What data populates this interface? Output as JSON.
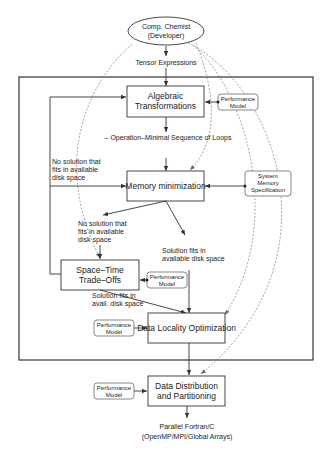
{
  "diagram": {
    "actor": {
      "line1": "Comp. Chemist",
      "line2": "(Developer)"
    },
    "input_label": "Tensor Expressions",
    "stages": {
      "algebraic": {
        "line1": "Algebraic",
        "line2": "Transformations"
      },
      "memory": {
        "line1": "Memory minimization"
      },
      "spacetime": {
        "line1": "Space–Time",
        "line2": "Trade–Offs"
      },
      "locality": {
        "line1": "Data Locality Optimization"
      },
      "distribution": {
        "line1": "Data Distribution",
        "line2": "and Partitioning"
      }
    },
    "side_inputs": {
      "perf_model_1": {
        "line1": "Performance",
        "line2": "Model"
      },
      "system_memory": {
        "line1": "System",
        "line2": "Memory",
        "line3": "Specification"
      },
      "perf_model_2": {
        "line1": "Performance",
        "line2": "Model"
      },
      "perf_model_3": {
        "line1": "Performance",
        "line2": "Model"
      },
      "perf_model_4": {
        "line1": "Performance",
        "line2": "Model"
      }
    },
    "edge_labels": {
      "op_minimal": "– Operation–Minimal Sequence of Loops",
      "no_solution_left": {
        "line1": "No solution that",
        "line2": "fits in available",
        "line3": "disk space"
      },
      "no_solution_mid": {
        "line1": "No solution that",
        "line2": "fits in available",
        "line3": "disk space"
      },
      "solution_fits": {
        "line1": "Solution fits in",
        "line2": "available disk space"
      },
      "solution_fits_avail": {
        "line1": "Solution fits in",
        "line2": "avail. disk space"
      }
    },
    "output": {
      "line1": "Parallel Fortran/C",
      "line2": "(OpenMP/MPI/Global Arrays)"
    }
  }
}
